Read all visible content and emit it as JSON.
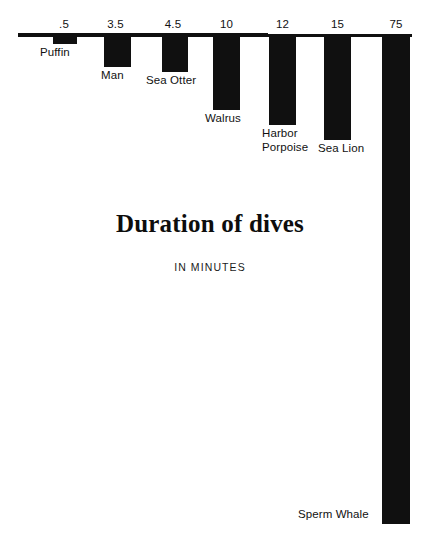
{
  "chart_data": {
    "type": "bar",
    "title": "Duration of dives",
    "subtitle": "IN MINUTES",
    "xlabel": "",
    "ylabel": "",
    "units": "minutes",
    "orientation": "downward-hanging-bars",
    "grid": false,
    "legend": false,
    "axis_position": "top",
    "ylim": [
      0,
      75
    ],
    "categories": [
      "Puffin",
      "Man",
      "Sea Otter",
      "Walrus",
      "Harbor\nPorpoise",
      "Sea Lion",
      "Sperm Whale"
    ],
    "values": [
      0.5,
      3.5,
      4.5,
      10,
      12,
      15,
      75
    ],
    "value_labels": [
      ".5",
      "3.5",
      "4.5",
      "10",
      "12",
      "15",
      "75"
    ],
    "bar_color": "#101010",
    "background_color": "#ffffff"
  },
  "bars": [
    {
      "name": "Puffin",
      "value_label": ".5",
      "label": "Puffin",
      "x": 53,
      "width": 24,
      "length": 8,
      "label_x": 40,
      "label_y": 46,
      "value_x": 42,
      "value_y": 18,
      "label_align": "left"
    },
    {
      "name": "Man",
      "value_label": "3.5",
      "label": "Man",
      "x": 104,
      "width": 27,
      "length": 31,
      "label_x": 101,
      "label_y": 69,
      "value_x": 92,
      "value_y": 18,
      "label_align": "left"
    },
    {
      "name": "Sea Otter",
      "value_label": "4.5",
      "label": "Sea Otter",
      "x": 162,
      "width": 26,
      "length": 36,
      "label_x": 146,
      "label_y": 74,
      "value_x": 150,
      "value_y": 18,
      "label_align": "left"
    },
    {
      "name": "Walrus",
      "value_label": "10",
      "label": "Walrus",
      "x": 213,
      "width": 27,
      "length": 74,
      "label_x": 205,
      "label_y": 112,
      "value_x": 203,
      "value_y": 18,
      "label_align": "left"
    },
    {
      "name": "Harbor Porpoise",
      "value_label": "12",
      "label": "Harbor\nPorpoise",
      "x": 269,
      "width": 27,
      "length": 89,
      "label_x": 262,
      "label_y": 127,
      "value_x": 259,
      "value_y": 18,
      "label_align": "left"
    },
    {
      "name": "Sea Lion",
      "value_label": "15",
      "label": "Sea Lion",
      "x": 324,
      "width": 27,
      "length": 104,
      "label_x": 318,
      "label_y": 142,
      "value_x": 314,
      "value_y": 18,
      "label_align": "left"
    },
    {
      "name": "Sperm Whale",
      "value_label": "75",
      "label": "Sperm Whale",
      "x": 382,
      "width": 28,
      "length": 488,
      "label_x": 298,
      "label_y": 508,
      "value_x": 372,
      "value_y": 18,
      "label_align": "left"
    }
  ],
  "axis": {
    "left": 18,
    "top": 34,
    "width": 394
  }
}
